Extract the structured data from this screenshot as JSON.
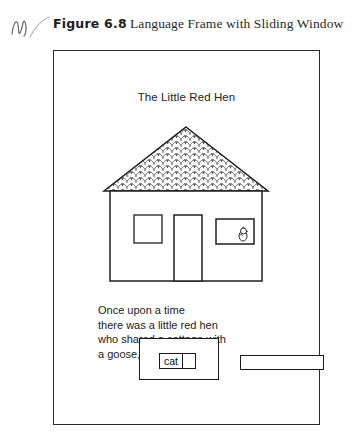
{
  "header": {
    "hand_mark_icon": "handwritten-initial-mark",
    "figure_label": "Figure 6.8",
    "figure_title": "Language Frame with Sliding Window"
  },
  "frame": {
    "story_title": "The Little Red Hen",
    "illustration": {
      "name": "house-illustration",
      "roof_icon": "shingled-roof",
      "door_icon": "door",
      "left_window_icon": "window",
      "right_window_icon": "window-with-hen",
      "hen_icon": "hen"
    },
    "story_lines": [
      "Once upon a time",
      "there was a little red hen",
      "who shared a cottage with",
      "a goose, a cat and a pig."
    ],
    "sliding_window": {
      "name": "sliding-window-card",
      "word": "cat",
      "blank_label": "",
      "extension_label": ""
    }
  },
  "colors": {
    "ink": "#222222",
    "frame_stroke": "#2a2a2a",
    "card_stroke": "#1a1a1a",
    "paper": "#ffffff"
  }
}
